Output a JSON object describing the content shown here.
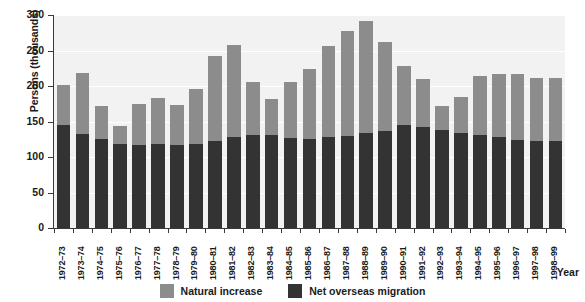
{
  "chart_data": {
    "type": "bar",
    "stacked": true,
    "title": "",
    "subtitle": "",
    "xlabel": "Year",
    "ylabel": "Persons (thousands)",
    "ylim": [
      0,
      300
    ],
    "ytick_values": [
      0,
      50,
      100,
      150,
      200,
      250,
      300
    ],
    "ytick_labels": [
      "0",
      "50",
      "100",
      "150",
      "200",
      "250",
      "300"
    ],
    "grid": true,
    "legend_position": "bottom",
    "categories": [
      "1972–73",
      "1973–74",
      "1974–75",
      "1975–76",
      "1976–77",
      "1977–78",
      "1978–79",
      "1979–80",
      "1980–81",
      "1981–82",
      "1982–83",
      "1983–84",
      "1984–85",
      "1985–86",
      "1986–87",
      "1987–88",
      "1988–89",
      "1989–90",
      "1990–91",
      "1991–92",
      "1992–93",
      "1993–94",
      "1994–95",
      "1995–96",
      "1996–97",
      "1997–98",
      "1998–99"
    ],
    "series": [
      {
        "name": "Net overseas migration",
        "color": "#333333",
        "values": [
          145,
          133,
          125,
          119,
          117,
          118,
          117,
          118,
          122,
          128,
          131,
          131,
          127,
          126,
          128,
          130,
          134,
          136,
          145,
          142,
          138,
          134,
          131,
          128,
          124,
          122,
          123
        ]
      },
      {
        "name": "Natural increase",
        "color": "#8c8c8c",
        "values": [
          57,
          85,
          47,
          25,
          58,
          65,
          56,
          78,
          120,
          130,
          74,
          51,
          79,
          98,
          128,
          148,
          157,
          126,
          83,
          68,
          34,
          50,
          83,
          89,
          93,
          89,
          88
        ]
      }
    ],
    "totals": [
      202,
      218,
      172,
      144,
      175,
      183,
      173,
      196,
      242,
      258,
      205,
      182,
      206,
      224,
      256,
      278,
      291,
      262,
      228,
      210,
      172,
      184,
      214,
      217,
      217,
      211,
      211
    ]
  },
  "legend": {
    "items": [
      {
        "label": "Natural increase",
        "color": "#8c8c8c",
        "swatch_name": "legend-swatch-natural-increase"
      },
      {
        "label": "Net overseas migration",
        "color": "#333333",
        "swatch_name": "legend-swatch-net-overseas-migration"
      }
    ]
  }
}
